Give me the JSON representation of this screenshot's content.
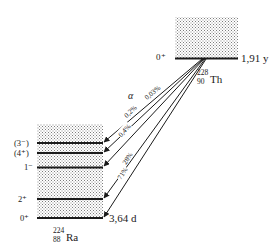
{
  "diagram": {
    "type": "nuclear-decay-scheme",
    "decay_mode": "α",
    "parent": {
      "mass_number": "228",
      "atomic_number": "90",
      "symbol": "Th",
      "half_life": "1,91 y",
      "ground_spin": "0⁺"
    },
    "daughter": {
      "mass_number": "224",
      "atomic_number": "88",
      "symbol": "Ra",
      "half_life": "3,64 d",
      "levels": [
        {
          "spin": "(3⁻)",
          "branch": "0,03%"
        },
        {
          "spin": "(4⁺)",
          "branch": ""
        },
        {
          "spin": "1⁻",
          "branch": "0,2%"
        },
        {
          "spin": "2⁺",
          "branch": "28%"
        },
        {
          "spin": "0⁺",
          "branch": "71%"
        }
      ]
    },
    "transitions": [
      {
        "to": "(3⁻)",
        "label": "0,03%"
      },
      {
        "to": "(4⁺)",
        "label": "0,2%"
      },
      {
        "to": "1⁻",
        "label": "0,4%"
      },
      {
        "to": "2⁺",
        "label": "28%"
      },
      {
        "to": "0⁺",
        "label": "71%"
      }
    ],
    "colors": {
      "line": "#1a1a1a",
      "stipple": "#9a9a9a",
      "background": "#ffffff"
    }
  }
}
